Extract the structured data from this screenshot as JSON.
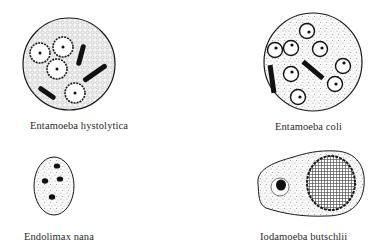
{
  "figure": {
    "panels": [
      {
        "id": "entamoeba-histolytica",
        "label": "Entamoeba hystolytica",
        "shape": "circle",
        "features": {
          "nuclei_count": 4,
          "chromatoid_bodies": 3
        }
      },
      {
        "id": "entamoeba-coli",
        "label": "Entamoeba coli",
        "shape": "circle",
        "features": {
          "nuclei_count": 8,
          "chromatoid_bodies": 2
        }
      },
      {
        "id": "endolimax-nana",
        "label": "Endolimax nana",
        "shape": "oval",
        "features": {
          "nuclei_count": 4
        }
      },
      {
        "id": "iodamoeba-butschlii",
        "label": "Iodamoeba butschlii",
        "shape": "pear",
        "features": {
          "nuclei_count": 1,
          "glycogen_vacuole": true
        }
      }
    ],
    "colors": {
      "ink": "#1a1a1a",
      "stipple": "#8a8a8a",
      "background": "#ffffff"
    }
  }
}
